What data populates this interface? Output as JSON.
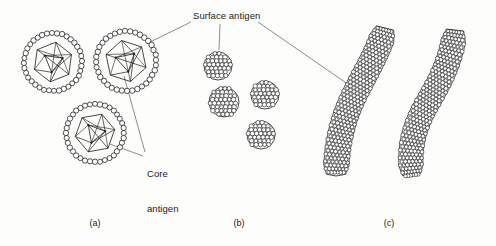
{
  "figure": {
    "background_color": "#fdfdfb",
    "ink_color": "#1a1a1a",
    "leader_color": "#5a5a5a",
    "width": 496,
    "height": 246
  },
  "labels": {
    "surface_antigen": "Surface antigen",
    "core_antigen_line1": "Core",
    "core_antigen_line2": "antigen"
  },
  "panels": [
    {
      "id": "a",
      "label": "(a)",
      "caption_x": 95,
      "description": "complete virions with surface coat and icosahedral core"
    },
    {
      "id": "b",
      "label": "(b)",
      "caption_x": 239,
      "description": "small spherical surface antigen particles"
    },
    {
      "id": "c",
      "label": "(c)",
      "caption_x": 389,
      "description": "filamentous surface antigen forms"
    }
  ],
  "chart_data": {
    "type": "diagram",
    "virions": [
      {
        "name": "virion-1",
        "cx": 53,
        "cy": 62,
        "shell_r": 29,
        "core_r": 20,
        "bead_r": 2.6,
        "bead_count": 36,
        "rotation": 8
      },
      {
        "name": "virion-2",
        "cx": 126,
        "cy": 61,
        "shell_r": 30,
        "core_r": 21,
        "bead_r": 2.7,
        "bead_count": 36,
        "rotation": -12
      },
      {
        "name": "virion-3",
        "cx": 95,
        "cy": 133,
        "shell_r": 29,
        "core_r": 20,
        "bead_r": 2.6,
        "bead_count": 36,
        "rotation": 20
      }
    ],
    "spheres": [
      {
        "name": "sphere-1",
        "cx": 218,
        "cy": 66,
        "r": 14
      },
      {
        "name": "sphere-2",
        "cx": 224,
        "cy": 102,
        "r": 15
      },
      {
        "name": "sphere-3",
        "cx": 265,
        "cy": 95,
        "r": 14
      },
      {
        "name": "sphere-4",
        "cx": 261,
        "cy": 135,
        "r": 14
      }
    ],
    "filaments": [
      {
        "name": "filament-left",
        "path": "M 385 28 C 379 52, 363 76, 352 100 C 341 124, 336 150, 336 176",
        "width": 25
      },
      {
        "name": "filament-right",
        "path": "M 455 30 C 452 58, 441 80, 428 102 C 414 126, 408 148, 412 176",
        "width": 24
      }
    ],
    "leaders": [
      {
        "name": "leader-surface-to-virion2",
        "from": [
          191,
          22
        ],
        "to": [
          148,
          43
        ]
      },
      {
        "name": "leader-surface-to-sphere1",
        "from": [
          220,
          24
        ],
        "to": [
          219,
          50
        ]
      },
      {
        "name": "leader-surface-to-filament",
        "from": [
          258,
          22
        ],
        "to": [
          352,
          87
        ]
      },
      {
        "name": "leader-core-to-virion2",
        "from": [
          145,
          152
        ],
        "to": [
          124,
          76
        ]
      },
      {
        "name": "leader-core-to-virion3",
        "from": [
          143,
          156
        ],
        "to": [
          110,
          144
        ]
      }
    ]
  }
}
